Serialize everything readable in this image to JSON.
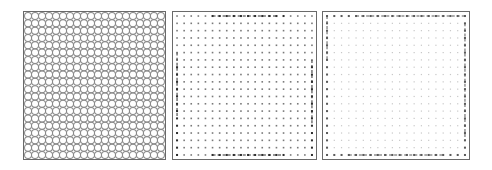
{
  "figure": {
    "panels": [
      {
        "id": "circle-grid",
        "label": "",
        "pattern": "circles",
        "rows": 20,
        "cols": 20,
        "box": {
          "x": 23,
          "y": 11,
          "w": 143,
          "h": 149
        },
        "color": "#8a8a8a"
      },
      {
        "id": "dot-grid",
        "label": "",
        "pattern": "dots",
        "rows": 20,
        "cols": 20,
        "box": {
          "x": 172,
          "y": 11,
          "w": 145,
          "h": 149
        },
        "color": "#7a7a7a",
        "edge_color": "#2e2e2e",
        "highlighted_edges": [
          "top-middle",
          "bottom-middle",
          "left-lower",
          "right-lower"
        ]
      },
      {
        "id": "faint-dot-grid",
        "label": "",
        "pattern": "faint-dots",
        "rows": 20,
        "cols": 20,
        "box": {
          "x": 322,
          "y": 11,
          "w": 148,
          "h": 149
        },
        "color": "#c8c8c8",
        "edge_color": "#5a5a5a",
        "highlighted_edges": [
          "top",
          "bottom",
          "left",
          "right"
        ]
      }
    ],
    "frame_color": "#6a6a6a"
  }
}
